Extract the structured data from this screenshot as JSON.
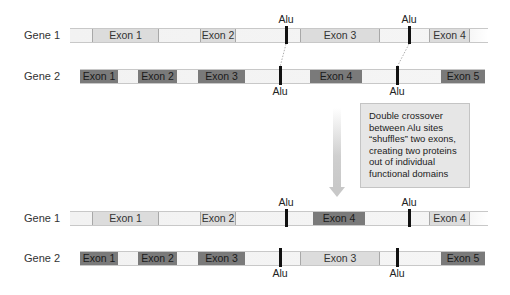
{
  "before": {
    "gene1": {
      "label": "Gene 1",
      "exons": [
        {
          "label": "Exon 1",
          "shade": "light"
        },
        {
          "label": "Exon 2",
          "shade": "light"
        },
        {
          "label": "Exon 3",
          "shade": "light"
        },
        {
          "label": "Exon 4",
          "shade": "light"
        }
      ],
      "alu_labels": [
        "Alu",
        "Alu"
      ]
    },
    "gene2": {
      "label": "Gene 2",
      "exons": [
        {
          "label": "Exon 1",
          "shade": "dark"
        },
        {
          "label": "Exon 2",
          "shade": "dark"
        },
        {
          "label": "Exon 3",
          "shade": "dark"
        },
        {
          "label": "Exon 4",
          "shade": "dark"
        },
        {
          "label": "Exon 5",
          "shade": "dark"
        }
      ],
      "alu_labels": [
        "Alu",
        "Alu"
      ]
    }
  },
  "callout": {
    "lines": [
      "Double crossover",
      "between Alu sites",
      "“shuffles” two exons,",
      "creating two proteins",
      "out of individual",
      "functional domains"
    ]
  },
  "after": {
    "gene1": {
      "label": "Gene 1",
      "exons": [
        {
          "label": "Exon 1",
          "shade": "light"
        },
        {
          "label": "Exon 2",
          "shade": "light"
        },
        {
          "label": "Exon 4",
          "shade": "dark"
        },
        {
          "label": "Exon 4",
          "shade": "light"
        }
      ],
      "alu_labels": [
        "Alu",
        "Alu"
      ]
    },
    "gene2": {
      "label": "Gene 2",
      "exons": [
        {
          "label": "Exon 1",
          "shade": "dark"
        },
        {
          "label": "Exon 2",
          "shade": "dark"
        },
        {
          "label": "Exon 3",
          "shade": "dark"
        },
        {
          "label": "Exon 3",
          "shade": "light"
        },
        {
          "label": "Exon 5",
          "shade": "dark"
        }
      ],
      "alu_labels": [
        "Alu",
        "Alu"
      ]
    }
  },
  "colors": {
    "light_exon": "#dcdcdc",
    "dark_exon": "#7a7a7a",
    "alu_marker": "#111111",
    "callout_bg": "#e6e6e6"
  }
}
